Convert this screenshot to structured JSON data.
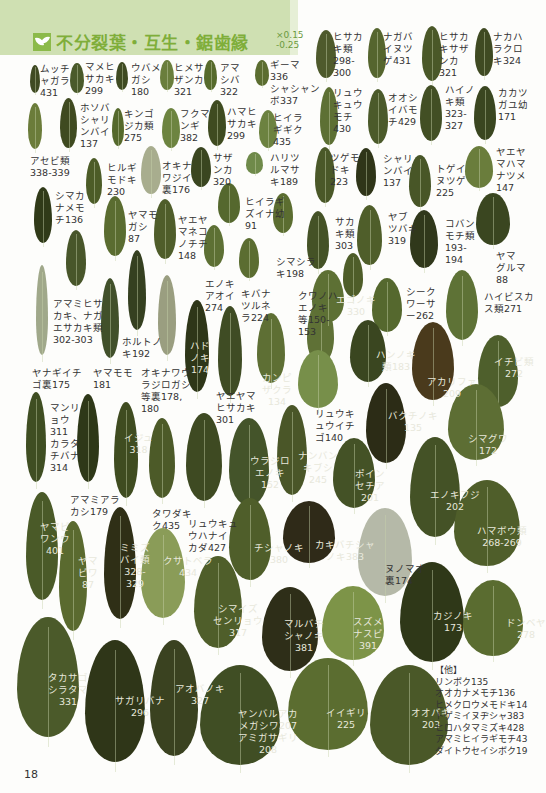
{
  "header": {
    "title": "不分裂葉・互生・鋸歯縁",
    "scale_top": "×0.15",
    "scale_bottom": "-0.25",
    "icon": "leaf-sprout-icon",
    "accent_color": "#7fae3a",
    "band_color": "#cfe0b2"
  },
  "page_number": "18",
  "labels": [
    {
      "text": "ムッチ\nャガラ\n431",
      "x": 40,
      "y": 63
    },
    {
      "text": "マメヒ\nサカキ\n299",
      "x": 85,
      "y": 61
    },
    {
      "text": "ウバメ\nガシ\n180",
      "x": 131,
      "y": 62
    },
    {
      "text": "ヒメサ\nザンカ\n321",
      "x": 174,
      "y": 62
    },
    {
      "text": "アマ\nシバ\n322",
      "x": 220,
      "y": 62
    },
    {
      "text": "ギーマ\n336\nシャシャン\nボ337",
      "x": 270,
      "y": 59
    },
    {
      "text": "ヒサカ\nキ類\n298-\n300",
      "x": 333,
      "y": 31
    },
    {
      "text": "ナガバ\nイヌツ\nゲ431",
      "x": 383,
      "y": 31
    },
    {
      "text": "ヒサカ\nキサザ\nンカ\n321",
      "x": 439,
      "y": 31
    },
    {
      "text": "ナカハ\nラクロ\nキ324",
      "x": 493,
      "y": 31
    },
    {
      "text": "ホソバ\nシャリ\nンバイ\n137",
      "x": 80,
      "y": 102
    },
    {
      "text": "キンゴ\nジカ類\n275",
      "x": 124,
      "y": 108
    },
    {
      "text": "フクマ\nンギ\n382",
      "x": 180,
      "y": 108
    },
    {
      "text": "ハマヒ\nサカキ\n299",
      "x": 227,
      "y": 106
    },
    {
      "text": "ヒイラ\nギギク\n435",
      "x": 273,
      "y": 112
    },
    {
      "text": "リュウ\nキュウ\nモチ\n430",
      "x": 333,
      "y": 87
    },
    {
      "text": "オオシ\nイバモ\nチ429",
      "x": 388,
      "y": 92
    },
    {
      "text": "ハイノ\nキ類\n323-\n327",
      "x": 445,
      "y": 84
    },
    {
      "text": "カカツ\nガユ幼\n171",
      "x": 498,
      "y": 87
    },
    {
      "text": "アセビ類\n338-339",
      "x": 30,
      "y": 155
    },
    {
      "text": "ヒルギ\nモドキ\n230",
      "x": 107,
      "y": 162
    },
    {
      "text": "オキナ\nワジイ\n裏176",
      "x": 162,
      "y": 160
    },
    {
      "text": "サザ\nンカ\n320",
      "x": 213,
      "y": 152
    },
    {
      "text": "ハリツ\nルマサ\nキ189",
      "x": 270,
      "y": 152
    },
    {
      "text": "ツゲモ\nドキ\n223",
      "x": 330,
      "y": 152
    },
    {
      "text": "シャリ\nンバイ\n137",
      "x": 383,
      "y": 153
    },
    {
      "text": "トゲイ\nヌツゲ\n225",
      "x": 436,
      "y": 163
    },
    {
      "text": "ヤエヤ\nマハマ\nナツメ\n147",
      "x": 496,
      "y": 146
    },
    {
      "text": "シマカ\nナメモ\nチ136",
      "x": 55,
      "y": 190
    },
    {
      "text": "ヤマモ\nガシ\n87",
      "x": 128,
      "y": 209
    },
    {
      "text": "ヤエヤ\nマネコ\nノチチ\n148",
      "x": 178,
      "y": 214
    },
    {
      "text": "ヒイラギ\nズイナ幼\n91",
      "x": 245,
      "y": 196
    },
    {
      "text": "サカ\nキ類\n303",
      "x": 335,
      "y": 216
    },
    {
      "text": "ヤブ\nツバキ\n319",
      "x": 388,
      "y": 211
    },
    {
      "text": "コバン\nモチ類\n193-\n194",
      "x": 445,
      "y": 218
    },
    {
      "text": "ヤマ\nグルマ\n88",
      "x": 496,
      "y": 250
    },
    {
      "text": "シマシラ\nキ198",
      "x": 276,
      "y": 256
    },
    {
      "text": "エノキ\nアオイ\n274",
      "x": 205,
      "y": 278
    },
    {
      "text": "キバナ\nツルネ\nラ224",
      "x": 241,
      "y": 288
    },
    {
      "text": "クワノハ\nエノキ\n等150-\n153",
      "x": 298,
      "y": 290
    },
    {
      "text": "シーク\nワーサ\nー262",
      "x": 406,
      "y": 286
    },
    {
      "text": "ハイビスカ\nス類271",
      "x": 484,
      "y": 291
    },
    {
      "text": "アマミヒサ\nカキ、ナガ\nエサカキ類\n302-303",
      "x": 53,
      "y": 298
    },
    {
      "text": "ホルトノ\nキ192",
      "x": 122,
      "y": 336
    },
    {
      "text": "ヤナギイチ\nゴ裏175",
      "x": 32,
      "y": 367
    },
    {
      "text": "ヤマモモ\n181",
      "x": 93,
      "y": 367
    },
    {
      "text": "オキナワウ\nラジロガシ\n等裏178,\n180",
      "x": 141,
      "y": 367
    },
    {
      "text": "ヤエヤマ\nヒサカキ\n301",
      "x": 216,
      "y": 390
    },
    {
      "text": "リュウキ\nュウイチ\nゴ140",
      "x": 315,
      "y": 408
    },
    {
      "text": "マンリ\nョウ\n311\nカラタ\nチバナ\n314",
      "x": 50,
      "y": 402
    },
    {
      "text": "アマミアラ\nカシ179",
      "x": 70,
      "y": 494
    },
    {
      "text": "タワダキ\nク435",
      "x": 152,
      "y": 508
    },
    {
      "text": "リュウキュ\nウハナイ\nカダ427",
      "x": 188,
      "y": 518
    }
  ],
  "leaf_labels": [
    {
      "text": "ハド\nノキ\n174",
      "x": 190,
      "y": 340
    },
    {
      "text": "カンピ\nザクラ\n134",
      "x": 262,
      "y": 372
    },
    {
      "text": "エゴノキ\n330",
      "x": 336,
      "y": 294
    },
    {
      "text": "ハンノキ\n類183",
      "x": 376,
      "y": 349
    },
    {
      "text": "アカリファ\n209",
      "x": 427,
      "y": 376
    },
    {
      "text": "イチビ類\n272",
      "x": 494,
      "y": 356
    },
    {
      "text": "バクチノキ\n135",
      "x": 388,
      "y": 410
    },
    {
      "text": "イジュ\n318",
      "x": 124,
      "y": 432
    },
    {
      "text": "ウラジロ\nエノキ\n152",
      "x": 250,
      "y": 455
    },
    {
      "text": "ナンバン\nキブシ\n245",
      "x": 298,
      "y": 450
    },
    {
      "text": "ポイン\nセチア\n201",
      "x": 355,
      "y": 468
    },
    {
      "text": "エノキフジ\n202",
      "x": 430,
      "y": 489
    },
    {
      "text": "シマグワ\n172",
      "x": 468,
      "y": 433
    },
    {
      "text": "ヤマビ\nワンウ\n401",
      "x": 40,
      "y": 521
    },
    {
      "text": "ヤマ\nビワ\n87",
      "x": 78,
      "y": 555
    },
    {
      "text": "ミミズ\nバイ類\n328-\n329",
      "x": 120,
      "y": 542
    },
    {
      "text": "クサトベラ\n434",
      "x": 163,
      "y": 555
    },
    {
      "text": "チシャノキ\n380",
      "x": 254,
      "y": 542
    },
    {
      "text": "カキバチシャ\nノキ383",
      "x": 315,
      "y": 539
    },
    {
      "text": "ハマボウ類\n268-269",
      "x": 477,
      "y": 525
    },
    {
      "text": "シマイズ\nセンリョウ\n317",
      "x": 213,
      "y": 603
    },
    {
      "text": "マルバチ\nシャノキ\n381",
      "x": 284,
      "y": 618
    },
    {
      "text": "スズメ\nナスビ\n391",
      "x": 353,
      "y": 616
    },
    {
      "text": "カジノキ\n173",
      "x": 433,
      "y": 610
    },
    {
      "text": "ドンベヤ\n278",
      "x": 506,
      "y": 617
    },
    {
      "text": "タカサゴ\nシラタマ\n331",
      "x": 48,
      "y": 672
    },
    {
      "text": "サガリバナ\n296",
      "x": 115,
      "y": 695
    },
    {
      "text": "アオバノキ\n327",
      "x": 175,
      "y": 683
    },
    {
      "text": "ヤンバルアカ\nメガシワ207\nアミガサギリ\n208",
      "x": 238,
      "y": 708
    },
    {
      "text": "イイギリ\n225",
      "x": 326,
      "y": 707
    },
    {
      "text": "オオバギ\n203",
      "x": 411,
      "y": 707
    }
  ],
  "dark_label": {
    "text": "ヌノマオ\n裏174",
    "x": 385,
    "y": 563
  },
  "other_list": {
    "heading": "【他】",
    "items": [
      "リンボク135",
      "オオカナメモチ136",
      "ヒメクロウメモドキ14",
      "トゲミイヌヂシャ383",
      "ヒロハタマミズキ428",
      "アマミヒイラギモチ43",
      "ダイトウセイシボク19"
    ]
  },
  "leaves": [
    [
      30,
      65,
      10,
      28,
      "#3f4a22"
    ],
    [
      70,
      63,
      14,
      30,
      "#4a5a2a"
    ],
    [
      116,
      62,
      12,
      28,
      "#3f4b22"
    ],
    [
      160,
      60,
      14,
      30,
      "#6a7e3c"
    ],
    [
      204,
      60,
      13,
      30,
      "#566a2c"
    ],
    [
      255,
      60,
      14,
      26,
      "#5b6d30"
    ],
    [
      316,
      30,
      20,
      48,
      "#4e5a2c"
    ],
    [
      368,
      28,
      18,
      50,
      "#55652e"
    ],
    [
      422,
      26,
      20,
      55,
      "#4a5828"
    ],
    [
      475,
      28,
      18,
      48,
      "#3f4a22"
    ],
    [
      28,
      103,
      14,
      46,
      "#6b7c3a"
    ],
    [
      60,
      98,
      17,
      50,
      "#3f4a20"
    ],
    [
      112,
      108,
      12,
      38,
      "#55692c"
    ],
    [
      162,
      108,
      18,
      40,
      "#6d8440"
    ],
    [
      208,
      100,
      18,
      46,
      "#3f4b20"
    ],
    [
      259,
      110,
      18,
      38,
      "#6c8240"
    ],
    [
      320,
      87,
      18,
      58,
      "#5d7034"
    ],
    [
      368,
      89,
      20,
      55,
      "#4b5a2a"
    ],
    [
      420,
      85,
      22,
      56,
      "#424f24"
    ],
    [
      474,
      86,
      22,
      54,
      "#3a4620"
    ],
    [
      86,
      158,
      16,
      46,
      "#4c5c27"
    ],
    [
      141,
      146,
      20,
      48,
      "#a8ad8e"
    ],
    [
      191,
      147,
      20,
      40,
      "#3a4620"
    ],
    [
      246,
      152,
      17,
      22,
      "#6f8a4a"
    ],
    [
      315,
      147,
      20,
      56,
      "#4a5828"
    ],
    [
      356,
      148,
      20,
      48,
      "#2f3518"
    ],
    [
      409,
      155,
      22,
      52,
      "#485627"
    ],
    [
      465,
      146,
      28,
      42,
      "#6a7d3c"
    ],
    [
      34,
      187,
      18,
      56,
      "#303a18"
    ],
    [
      104,
      196,
      22,
      60,
      "#5a6c30"
    ],
    [
      154,
      199,
      22,
      60,
      "#4f5d2a"
    ],
    [
      218,
      183,
      22,
      40,
      "#55682e"
    ],
    [
      273,
      193,
      20,
      40,
      "#5b6d30"
    ],
    [
      307,
      211,
      22,
      58,
      "#445226"
    ],
    [
      357,
      205,
      25,
      60,
      "#4f5e2a"
    ],
    [
      410,
      210,
      28,
      58,
      "#30381b"
    ],
    [
      476,
      193,
      34,
      52,
      "#3a4620"
    ],
    [
      66,
      230,
      20,
      56,
      "#48562a"
    ],
    [
      204,
      225,
      20,
      42,
      "#5d7034"
    ],
    [
      239,
      238,
      20,
      40,
      "#5b6d31"
    ],
    [
      343,
      253,
      20,
      44,
      "#4e5d29"
    ],
    [
      36,
      265,
      12,
      90,
      "#a0a88a"
    ],
    [
      101,
      278,
      18,
      80,
      "#41502a"
    ],
    [
      128,
      250,
      18,
      80,
      "#354020"
    ],
    [
      158,
      275,
      18,
      80,
      "#9a9e80"
    ],
    [
      185,
      300,
      24,
      92,
      "#2e3618"
    ],
    [
      218,
      306,
      24,
      90,
      "#3f4c24"
    ],
    [
      257,
      313,
      28,
      70,
      "#5e6f34"
    ],
    [
      307,
      300,
      27,
      64,
      "#5f7136"
    ],
    [
      312,
      270,
      32,
      52,
      "#5d7034"
    ],
    [
      372,
      278,
      30,
      54,
      "#55682e"
    ],
    [
      350,
      320,
      36,
      62,
      "#3a4620"
    ],
    [
      412,
      322,
      42,
      78,
      "#4a3a1c"
    ],
    [
      446,
      270,
      32,
      70,
      "#5e7236"
    ],
    [
      478,
      335,
      40,
      72,
      "#4e5f2c"
    ],
    [
      298,
      350,
      40,
      58,
      "#778f4a"
    ],
    [
      26,
      392,
      20,
      90,
      "#3f4e22"
    ],
    [
      77,
      394,
      22,
      88,
      "#2e3818"
    ],
    [
      114,
      402,
      24,
      96,
      "#3f4c20"
    ],
    [
      149,
      418,
      26,
      80,
      "#4c5a28"
    ],
    [
      186,
      413,
      36,
      88,
      "#3e4a22"
    ],
    [
      229,
      418,
      40,
      88,
      "#44542a"
    ],
    [
      277,
      405,
      30,
      90,
      "#4a5628"
    ],
    [
      333,
      438,
      42,
      70,
      "#445226"
    ],
    [
      366,
      383,
      40,
      80,
      "#2c2c16"
    ],
    [
      410,
      437,
      50,
      100,
      "#445226"
    ],
    [
      448,
      384,
      56,
      76,
      "#5d6e34"
    ],
    [
      26,
      492,
      32,
      108,
      "#4a5a28"
    ],
    [
      59,
      521,
      28,
      110,
      "#5a6a2f"
    ],
    [
      104,
      507,
      32,
      112,
      "#2f2f16"
    ],
    [
      141,
      528,
      44,
      90,
      "#8a9c58"
    ],
    [
      229,
      498,
      42,
      82,
      "#4f5e2a"
    ],
    [
      283,
      501,
      52,
      62,
      "#2f2a18"
    ],
    [
      358,
      508,
      54,
      88,
      "#b5b9a8"
    ],
    [
      454,
      480,
      66,
      86,
      "#4f5e2a"
    ],
    [
      194,
      556,
      48,
      92,
      "#4f5e2a"
    ],
    [
      262,
      587,
      56,
      84,
      "#2e2e18"
    ],
    [
      322,
      586,
      62,
      74,
      "#7d9448"
    ],
    [
      400,
      562,
      64,
      100,
      "#2f3818"
    ],
    [
      463,
      580,
      60,
      76,
      "#5a6c30"
    ],
    [
      17,
      617,
      62,
      120,
      "#4b5a2a"
    ],
    [
      85,
      640,
      60,
      122,
      "#2f3618"
    ],
    [
      150,
      640,
      48,
      116,
      "#3a4220"
    ],
    [
      200,
      665,
      80,
      100,
      "#404e24"
    ],
    [
      288,
      658,
      80,
      92,
      "#5b6d30"
    ],
    [
      370,
      665,
      78,
      100,
      "#4a5828"
    ]
  ]
}
